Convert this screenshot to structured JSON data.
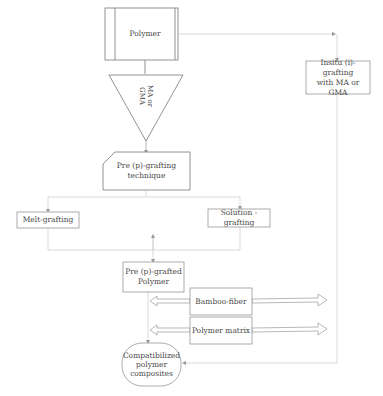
{
  "diagram": {
    "nodes": {
      "polymer": {
        "label": "Polymer"
      },
      "grafting_agent": {
        "label_line1": "MA or",
        "label_line2": "GMA"
      },
      "pre_grafting_technique": {
        "label_line1": "Pre (p)-grafting",
        "label_line2": "technique"
      },
      "melt_grafting": {
        "label": "Melt-grafting"
      },
      "solution_grafting": {
        "label": "Solution -grafting"
      },
      "pre_grafted_polymer": {
        "label_line1": "Pre (p)-grafted",
        "label_line2": "Polymer"
      },
      "bamboo_fiber": {
        "label": "Bamboo-fiber"
      },
      "polymer_matrix": {
        "label": "Polymer matrix"
      },
      "compatibilized": {
        "label_line1": "Compatibilized",
        "label_line2": "polymer",
        "label_line3": "composites"
      },
      "insitu_grafting": {
        "label_line1": "Insitu (i)-grafting",
        "label_line2": "with MA or GMA"
      }
    },
    "colors": {
      "line": "#8a8a8a",
      "light_line": "#c8c8c8",
      "text": "#4a4a4a"
    }
  }
}
